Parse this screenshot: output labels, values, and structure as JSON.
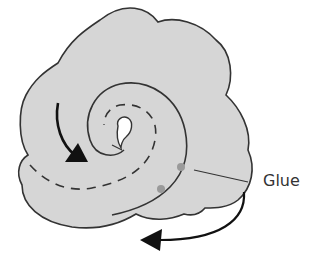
{
  "diagram": {
    "labels": {
      "glue": "Glue"
    },
    "colors": {
      "fill": "#d6d6d6",
      "stroke": "#333333",
      "glue_dot": "#9a9a9a",
      "background": "#ffffff"
    },
    "elements": [
      "cloud-shaped-sheet",
      "spiral-roll-line",
      "dashed-spiral-fold-line",
      "center-hole",
      "curved-arrow-inward",
      "curved-arrow-rotate",
      "glue-dots",
      "glue-leader-line"
    ]
  }
}
